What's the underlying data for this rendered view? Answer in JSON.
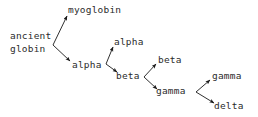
{
  "diagram": {
    "background_color": "#ffffff",
    "text_color": "#2b2b2b",
    "edge_color": "#1a1a1a",
    "nodes": [
      {
        "id": "ancient",
        "label": "ancient",
        "x": 10,
        "y": 30
      },
      {
        "id": "globin",
        "label": "globin",
        "x": 10,
        "y": 43
      },
      {
        "id": "myoglobin",
        "label": "myoglobin",
        "x": 68,
        "y": 4
      },
      {
        "id": "alpha1",
        "label": "alpha",
        "x": 72,
        "y": 59
      },
      {
        "id": "alpha2",
        "label": "alpha",
        "x": 114,
        "y": 36
      },
      {
        "id": "beta1",
        "label": "beta",
        "x": 116,
        "y": 70
      },
      {
        "id": "beta2",
        "label": "beta",
        "x": 158,
        "y": 54
      },
      {
        "id": "gamma1",
        "label": "gamma",
        "x": 156,
        "y": 85
      },
      {
        "id": "gamma2",
        "label": "gamma",
        "x": 212,
        "y": 70
      },
      {
        "id": "delta",
        "label": "delta",
        "x": 214,
        "y": 100
      }
    ],
    "edges": [
      {
        "id": "edge-ancientglobin-myoglobin",
        "from": "ancient globin",
        "to": "myoglobin",
        "x1": 53,
        "y1": 45,
        "x2": 67,
        "y2": 16
      },
      {
        "id": "edge-ancientglobin-alpha",
        "from": "ancient globin",
        "to": "alpha",
        "x1": 53,
        "y1": 45,
        "x2": 70,
        "y2": 61
      },
      {
        "id": "edge-alpha-alpha",
        "from": "alpha",
        "to": "alpha",
        "x1": 106,
        "y1": 64,
        "x2": 113,
        "y2": 47
      },
      {
        "id": "edge-alpha-beta",
        "from": "alpha",
        "to": "beta",
        "x1": 106,
        "y1": 64,
        "x2": 117,
        "y2": 72
      },
      {
        "id": "edge-beta-beta",
        "from": "beta",
        "to": "beta",
        "x1": 144,
        "y1": 77,
        "x2": 156,
        "y2": 64
      },
      {
        "id": "edge-beta-gamma",
        "from": "beta",
        "to": "gamma",
        "x1": 144,
        "y1": 77,
        "x2": 157,
        "y2": 89
      },
      {
        "id": "edge-gamma-gamma",
        "from": "gamma",
        "to": "gamma",
        "x1": 196,
        "y1": 92,
        "x2": 210,
        "y2": 80
      },
      {
        "id": "edge-gamma-delta",
        "from": "gamma",
        "to": "delta",
        "x1": 196,
        "y1": 92,
        "x2": 214,
        "y2": 103
      }
    ]
  }
}
